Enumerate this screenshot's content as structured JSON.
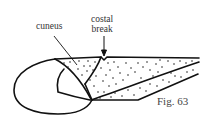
{
  "figure": {
    "caption": "Fig. 63",
    "labels": {
      "cuneus": "cuneus",
      "costal_line1": "costal",
      "costal_line2": "break"
    },
    "colors": {
      "stroke": "#111111",
      "stipple": "#222222",
      "background": "#ffffff"
    }
  }
}
